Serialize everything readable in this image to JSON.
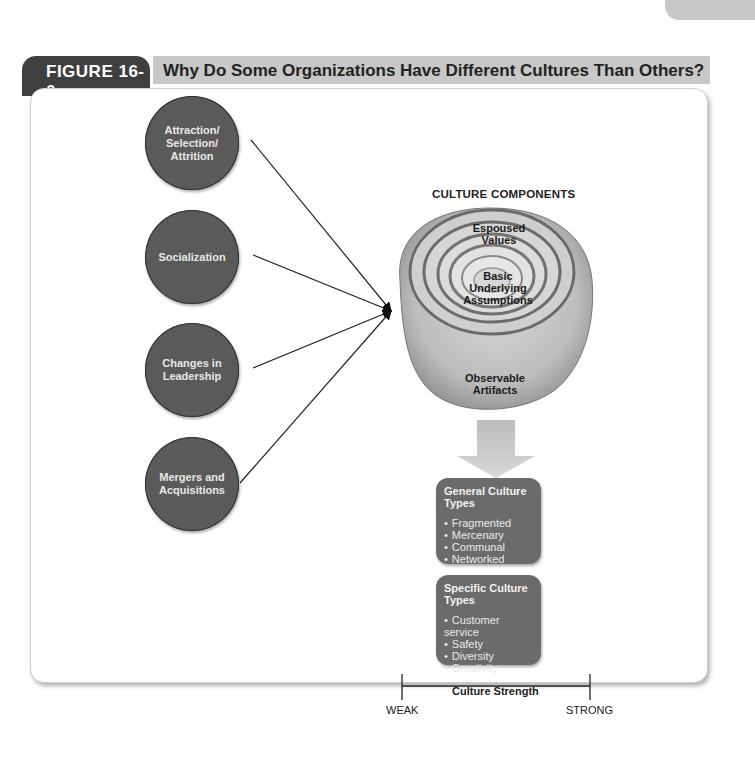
{
  "header": {
    "figure_label": "FIGURE 16-6",
    "figure_title": "Why Do Some Organizations Have Different Cultures Than Others?"
  },
  "causes": [
    {
      "label": "Attraction/ Selection/ Attrition"
    },
    {
      "label": "Socialization"
    },
    {
      "label": "Changes in Leadership"
    },
    {
      "label": "Mergers and Acquisitions"
    }
  ],
  "components": {
    "title": "CULTURE COMPONENTS",
    "layers": {
      "inner": "Basic Underlying Assumptions",
      "middle": "Espoused Values",
      "outer": "Observable Artifacts"
    }
  },
  "general_types": {
    "title": "General Culture Types",
    "items": [
      "Fragmented",
      "Mercenary",
      "Communal",
      "Networked"
    ]
  },
  "specific_types": {
    "title": "Specific Culture Types",
    "items": [
      "Customer service",
      "Safety",
      "Diversity",
      "Creativity"
    ]
  },
  "strength": {
    "title": "Culture Strength",
    "low": "WEAK",
    "high": "STRONG"
  },
  "colors": {
    "dark": "#3f3f3f",
    "circle": "#5a5a5a",
    "box": "#6b6b6b",
    "title_bar": "#c8c8c8"
  }
}
